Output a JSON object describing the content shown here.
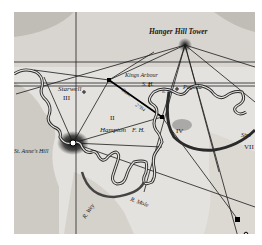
{
  "map": {
    "title": "Hanger Hill Tower triangulation",
    "colors": {
      "paper": "#e4e2de",
      "ink": "#1a1a1a",
      "river": "#333333",
      "terrain": "#8a8680"
    },
    "places": {
      "hanger_hill": "Hanger Hill Tower",
      "kings_arbour": "Kings Arbour",
      "sh": "S. H.",
      "pagoda": "Pagoda",
      "starwell": "Starwell",
      "hampton": "Hampton",
      "fh": "F. H.",
      "st_annes_hill": "St. Anne's Hill",
      "r_wey": "R. Wey",
      "r_mole": "R. Mole",
      "banstead": "Banstead",
      "streatham": "Stre",
      "base": "Base",
      "base_measure": "27B4",
      "r_th": "R. Th."
    },
    "regions": [
      "I",
      "II",
      "III",
      "IV",
      "VII"
    ]
  }
}
